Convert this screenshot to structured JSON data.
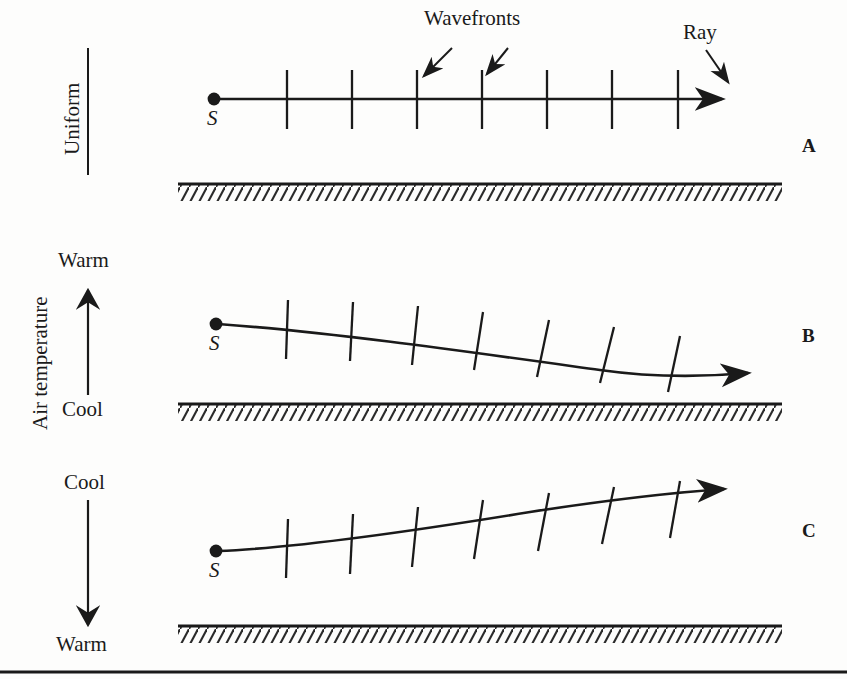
{
  "figure": {
    "title_annotations": {
      "wavefronts_label": "Wavefronts",
      "ray_label": "Ray"
    },
    "source_marker_label": "S",
    "axis": {
      "vertical_axis_label": "Air temperature",
      "uniform_label": "Uniform"
    },
    "panels": [
      {
        "letter": "A",
        "condition": "Uniform",
        "top_word": "",
        "bottom_word": "",
        "source_label": "S",
        "ray_shape": "straight-horizontal",
        "wavefront_count": 7
      },
      {
        "letter": "B",
        "condition": "Warm above, Cool below",
        "top_word": "Warm",
        "bottom_word": "Cool",
        "source_label": "S",
        "ray_shape": "curves-downward",
        "wavefront_count": 7
      },
      {
        "letter": "C",
        "condition": "Cool above, Warm below",
        "top_word": "Cool",
        "bottom_word": "Warm",
        "source_label": "S",
        "ray_shape": "curves-upward",
        "wavefront_count": 7
      }
    ],
    "colors": {
      "ink": "#1a1a1a",
      "background": "#fdfdfc",
      "ground_hatch": "#2a2a2a"
    }
  }
}
